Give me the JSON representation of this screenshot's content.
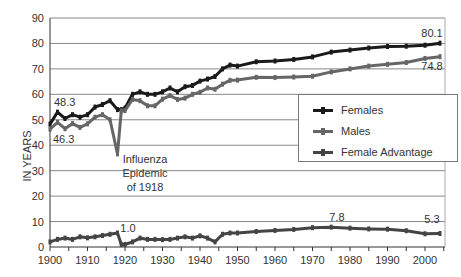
{
  "chart_data": {
    "type": "line",
    "title": "",
    "xlabel": "",
    "ylabel": "IN YEARS",
    "xlim": [
      1900,
      2005
    ],
    "ylim": [
      0,
      90
    ],
    "x_ticks": [
      "1900",
      "1910",
      "1920",
      "1930",
      "1940",
      "1950",
      "1960",
      "1970",
      "1980",
      "1990",
      "2000"
    ],
    "y_ticks": [
      "0",
      "10",
      "20",
      "30",
      "40",
      "50",
      "60",
      "70",
      "80",
      "90"
    ],
    "grid": "horizontal",
    "legend_position": "right-middle",
    "x": [
      1900,
      1902,
      1904,
      1906,
      1908,
      1910,
      1912,
      1914,
      1916,
      1918,
      1919,
      1920,
      1922,
      1924,
      1926,
      1928,
      1930,
      1932,
      1934,
      1936,
      1938,
      1940,
      1942,
      1944,
      1946,
      1948,
      1950,
      1955,
      1960,
      1965,
      1970,
      1975,
      1980,
      1985,
      1990,
      1995,
      2000,
      2004
    ],
    "series": [
      {
        "name": "Females",
        "color": "#1a1a1a",
        "values": [
          48.3,
          53.0,
          50.5,
          52.0,
          51.0,
          52.0,
          55.0,
          56.0,
          57.5,
          54.0,
          54.0,
          54.6,
          60.0,
          61.0,
          60.0,
          60.0,
          61.0,
          62.5,
          61.0,
          63.0,
          63.5,
          65.2,
          66.0,
          67.0,
          70.0,
          71.5,
          71.1,
          72.8,
          73.1,
          73.7,
          74.7,
          76.6,
          77.4,
          78.2,
          78.8,
          78.9,
          79.3,
          80.1
        ]
      },
      {
        "name": "Males",
        "color": "#666666",
        "values": [
          46.3,
          49.0,
          46.5,
          48.5,
          47.0,
          48.4,
          51.0,
          52.0,
          50.0,
          36.6,
          53.5,
          53.6,
          58.0,
          57.5,
          55.5,
          55.5,
          58.1,
          59.5,
          58.0,
          58.5,
          60.0,
          60.8,
          62.5,
          62.0,
          64.0,
          65.5,
          65.6,
          66.7,
          66.6,
          66.8,
          67.1,
          68.8,
          70.0,
          71.1,
          71.8,
          72.5,
          74.1,
          74.8
        ]
      },
      {
        "name": "Female Advantage",
        "color": "#444444",
        "values": [
          2.0,
          3.0,
          3.5,
          3.0,
          4.0,
          3.6,
          4.0,
          4.5,
          5.0,
          5.5,
          1.0,
          1.0,
          2.0,
          3.5,
          3.0,
          3.0,
          2.9,
          3.0,
          3.5,
          4.0,
          3.5,
          4.4,
          3.5,
          2.0,
          5.0,
          5.5,
          5.5,
          6.1,
          6.5,
          6.9,
          7.6,
          7.8,
          7.4,
          7.1,
          7.0,
          6.4,
          5.2,
          5.3
        ]
      }
    ],
    "annotations": [
      {
        "text": "48.3",
        "x": 1900,
        "series": "Females"
      },
      {
        "text": "46.3",
        "x": 1900,
        "series": "Males"
      },
      {
        "text": "Influenza",
        "x": 1918
      },
      {
        "text": "Epidemic",
        "x": 1918
      },
      {
        "text": "of 1918",
        "x": 1918
      },
      {
        "text": "1.0",
        "x": 1919,
        "series": "Female Advantage"
      },
      {
        "text": "7.8",
        "x": 1975,
        "series": "Female Advantage"
      },
      {
        "text": "5.3",
        "x": 2004,
        "series": "Female Advantage"
      },
      {
        "text": "80.1",
        "x": 2004,
        "series": "Females"
      },
      {
        "text": "74.8",
        "x": 2004,
        "series": "Males"
      }
    ]
  },
  "legend": {
    "items": [
      {
        "label": "Females",
        "color": "#1a1a1a"
      },
      {
        "label": "Males",
        "color": "#666666"
      },
      {
        "label": "Female Advantage",
        "color": "#444444"
      }
    ]
  },
  "labels": {
    "ylabel": "IN YEARS",
    "ann_f1900": "48.3",
    "ann_m1900": "46.3",
    "ann_flu1": "Influenza",
    "ann_flu2": "Epidemic",
    "ann_flu3": "of 1918",
    "ann_adv1919": "1.0",
    "ann_adv1975": "7.8",
    "ann_adv2004": "5.3",
    "ann_f2004": "80.1",
    "ann_m2004": "74.8"
  }
}
